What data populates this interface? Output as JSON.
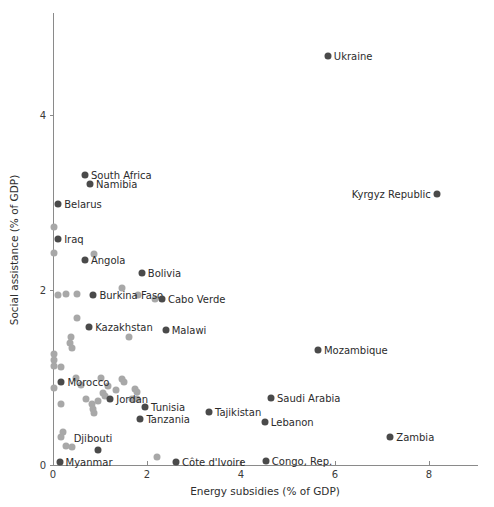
{
  "chart_data": {
    "type": "scatter",
    "title": "",
    "xlabel": "Energy subsidies (% of GDP)",
    "ylabel": "Social assistance (% of GDP)",
    "xlim": [
      0,
      8.6
    ],
    "ylim": [
      0,
      5.0
    ],
    "xticks": [
      0,
      2,
      4,
      6,
      8
    ],
    "xticklabels": [
      "0",
      "2",
      "4",
      "6",
      "8"
    ],
    "yticks": [
      0,
      2,
      4
    ],
    "yticklabels": [
      "0",
      "2",
      "4"
    ],
    "grid": false,
    "legend": "none",
    "colors": {
      "labeled_point": "#4a4a4a",
      "unlabeled_point": "#a8a8a8",
      "axis": "#8a8a8a",
      "text": "#2b2b2b",
      "background": "#ffffff"
    },
    "labeled_points": [
      {
        "name": "Ukraine",
        "x": 5.85,
        "y": 4.68,
        "label_side": "right"
      },
      {
        "name": "South Africa",
        "x": 0.68,
        "y": 3.32,
        "label_side": "right"
      },
      {
        "name": "Namibia",
        "x": 0.79,
        "y": 3.21,
        "label_side": "right"
      },
      {
        "name": "Kyrgyz Republic",
        "x": 8.17,
        "y": 3.1,
        "label_side": "left"
      },
      {
        "name": "Belarus",
        "x": 0.11,
        "y": 2.99,
        "label_side": "right"
      },
      {
        "name": "Iraq",
        "x": 0.11,
        "y": 2.59,
        "label_side": "right"
      },
      {
        "name": "Angola",
        "x": 0.68,
        "y": 2.34,
        "label_side": "right"
      },
      {
        "name": "Bolivia",
        "x": 1.89,
        "y": 2.2,
        "label_side": "right"
      },
      {
        "name": "Burkina Faso",
        "x": 0.86,
        "y": 1.95,
        "label_side": "right"
      },
      {
        "name": "Cabo Verde",
        "x": 2.32,
        "y": 1.9,
        "label_side": "right"
      },
      {
        "name": "Kazakhstan",
        "x": 0.77,
        "y": 1.58,
        "label_side": "right"
      },
      {
        "name": "Malawi",
        "x": 2.4,
        "y": 1.55,
        "label_side": "right"
      },
      {
        "name": "Mozambique",
        "x": 5.64,
        "y": 1.32,
        "label_side": "right"
      },
      {
        "name": "Morocco",
        "x": 0.18,
        "y": 0.95,
        "label_side": "right"
      },
      {
        "name": "Jordan",
        "x": 1.22,
        "y": 0.76,
        "label_side": "right"
      },
      {
        "name": "Saudi Arabia",
        "x": 4.64,
        "y": 0.77,
        "label_side": "right"
      },
      {
        "name": "Tunisia",
        "x": 1.96,
        "y": 0.66,
        "label_side": "right"
      },
      {
        "name": "Tajikistan",
        "x": 3.32,
        "y": 0.61,
        "label_side": "right"
      },
      {
        "name": "Lebanon",
        "x": 4.51,
        "y": 0.49,
        "label_side": "right"
      },
      {
        "name": "Tanzania",
        "x": 1.86,
        "y": 0.53,
        "label_side": "right"
      },
      {
        "name": "Zambia",
        "x": 7.18,
        "y": 0.32,
        "label_side": "right"
      },
      {
        "name": "Djibouti",
        "x": 0.95,
        "y": 0.17,
        "label_side": "above"
      },
      {
        "name": "Myanmar",
        "x": 0.14,
        "y": 0.03,
        "label_side": "right"
      },
      {
        "name": "Côte d'Ivoire",
        "x": 2.62,
        "y": 0.03,
        "label_side": "right"
      },
      {
        "name": "Congo, Rep.",
        "x": 4.53,
        "y": 0.05,
        "label_side": "right"
      }
    ],
    "unlabeled_points": [
      {
        "x": 0.02,
        "y": 2.72
      },
      {
        "x": 0.02,
        "y": 2.42
      },
      {
        "x": 0.88,
        "y": 2.41
      },
      {
        "x": 0.27,
        "y": 1.96
      },
      {
        "x": 0.11,
        "y": 1.94
      },
      {
        "x": 0.52,
        "y": 1.96
      },
      {
        "x": 1.47,
        "y": 2.03
      },
      {
        "x": 1.82,
        "y": 1.94
      },
      {
        "x": 2.18,
        "y": 1.9
      },
      {
        "x": 0.52,
        "y": 1.68
      },
      {
        "x": 0.38,
        "y": 1.46
      },
      {
        "x": 0.36,
        "y": 1.4
      },
      {
        "x": 0.41,
        "y": 1.34
      },
      {
        "x": 1.61,
        "y": 1.46
      },
      {
        "x": 0.02,
        "y": 1.27
      },
      {
        "x": 0.03,
        "y": 1.2
      },
      {
        "x": 0.03,
        "y": 1.13
      },
      {
        "x": 0.17,
        "y": 1.12
      },
      {
        "x": 0.48,
        "y": 1.0
      },
      {
        "x": 0.6,
        "y": 0.92
      },
      {
        "x": 1.03,
        "y": 1.0
      },
      {
        "x": 1.46,
        "y": 0.98
      },
      {
        "x": 1.52,
        "y": 0.95
      },
      {
        "x": 0.02,
        "y": 0.88
      },
      {
        "x": 1.18,
        "y": 0.9
      },
      {
        "x": 1.35,
        "y": 0.86
      },
      {
        "x": 1.74,
        "y": 0.87
      },
      {
        "x": 1.78,
        "y": 0.83
      },
      {
        "x": 1.06,
        "y": 0.82
      },
      {
        "x": 1.1,
        "y": 0.79
      },
      {
        "x": 1.68,
        "y": 0.76
      },
      {
        "x": 1.79,
        "y": 0.75
      },
      {
        "x": 0.17,
        "y": 0.7
      },
      {
        "x": 0.7,
        "y": 0.76
      },
      {
        "x": 0.96,
        "y": 0.73
      },
      {
        "x": 0.83,
        "y": 0.7
      },
      {
        "x": 0.85,
        "y": 0.64
      },
      {
        "x": 0.88,
        "y": 0.6
      },
      {
        "x": 0.22,
        "y": 0.38
      },
      {
        "x": 0.17,
        "y": 0.32
      },
      {
        "x": 0.27,
        "y": 0.22
      },
      {
        "x": 0.4,
        "y": 0.21
      },
      {
        "x": 2.21,
        "y": 0.09
      }
    ]
  },
  "figure": {
    "width": 494,
    "height": 507
  }
}
